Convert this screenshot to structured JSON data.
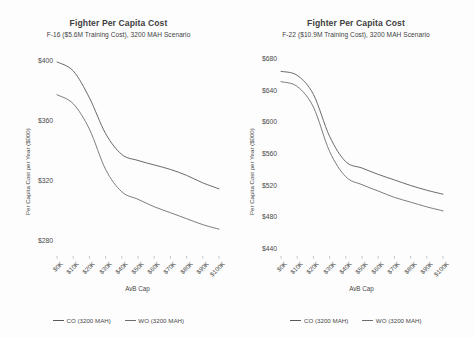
{
  "page": {
    "background": "#fdfdfd",
    "panel_count": 2
  },
  "charts": [
    {
      "id": "left",
      "title": "Fighter Per Capita Cost",
      "subtitle": "F-16 ($5.6M Training Cost), 3200 MAH Scenario",
      "xlabel": "AvB Cap",
      "ylabel": "Per Capita Cost per Year ($000)",
      "legend": [
        {
          "label": "CO (3200 MAH)",
          "color": "#595959"
        },
        {
          "label": "WO (3200 MAH)",
          "color": "#6e6e6e"
        }
      ]
    },
    {
      "id": "right",
      "title": "Fighter Per Capita Cost",
      "subtitle": "F-22 ($10.9M Training Cost), 3200 MAH Scenario",
      "xlabel": "AvB Cap",
      "ylabel": "Per Capita Cost per Year ($000)",
      "legend": [
        {
          "label": "CO (3200 MAH)",
          "color": "#595959"
        },
        {
          "label": "WO (3200 MAH)",
          "color": "#6e6e6e"
        }
      ]
    }
  ],
  "chart_data": [
    {
      "type": "line",
      "id": "f16-per-capita-cost",
      "title": "Fighter Per Capita Cost",
      "subtitle": "F-16 ($5.6M Training Cost), 3200 MAH Scenario",
      "xlabel": "AvB Cap",
      "ylabel": "Per Capita Cost per Year ($000)",
      "categories": [
        "$0K",
        "$10K",
        "$20K",
        "$30K",
        "$40K",
        "$50K",
        "$60K",
        "$70K",
        "$80K",
        "$90K",
        "$100K"
      ],
      "x": [
        0,
        10,
        20,
        30,
        40,
        50,
        60,
        70,
        80,
        90,
        100
      ],
      "ylim": [
        270,
        408
      ],
      "yticks": [
        280,
        320,
        360,
        400
      ],
      "yticklabels": [
        "$280",
        "$320",
        "$360",
        "$400"
      ],
      "grid": false,
      "legend_position": "bottom",
      "series": [
        {
          "name": "CO (3200 MAH)",
          "color": "#595959",
          "values": [
            400,
            394,
            376,
            352,
            338,
            334,
            331,
            328,
            324,
            319,
            315
          ]
        },
        {
          "name": "WO (3200 MAH)",
          "color": "#6e6e6e",
          "values": [
            378,
            372,
            355,
            328,
            313,
            308,
            303,
            299,
            295,
            291,
            288
          ]
        }
      ]
    },
    {
      "type": "line",
      "id": "f22-per-capita-cost",
      "title": "Fighter Per Capita Cost",
      "subtitle": "F-22 ($10.9M Training Cost), 3200 MAH Scenario",
      "xlabel": "AvB Cap",
      "ylabel": "Per Capita Cost per Year ($000)",
      "categories": [
        "$0K",
        "$10K",
        "$20K",
        "$30K",
        "$40K",
        "$50K",
        "$60K",
        "$70K",
        "$80K",
        "$90K",
        "$100K"
      ],
      "x": [
        0,
        10,
        20,
        30,
        40,
        50,
        60,
        70,
        80,
        90,
        100
      ],
      "ylim": [
        432,
        692
      ],
      "yticks": [
        440,
        480,
        520,
        560,
        600,
        640,
        680
      ],
      "yticklabels": [
        "$440",
        "$480",
        "$520",
        "$560",
        "$600",
        "$640",
        "$680"
      ],
      "grid": false,
      "legend_position": "bottom",
      "series": [
        {
          "name": "CO (3200 MAH)",
          "color": "#595959",
          "values": [
            665,
            660,
            636,
            583,
            551,
            543,
            535,
            528,
            521,
            515,
            510
          ]
        },
        {
          "name": "WO (3200 MAH)",
          "color": "#6e6e6e",
          "values": [
            652,
            646,
            620,
            564,
            532,
            522,
            514,
            506,
            500,
            494,
            489
          ]
        }
      ]
    }
  ]
}
